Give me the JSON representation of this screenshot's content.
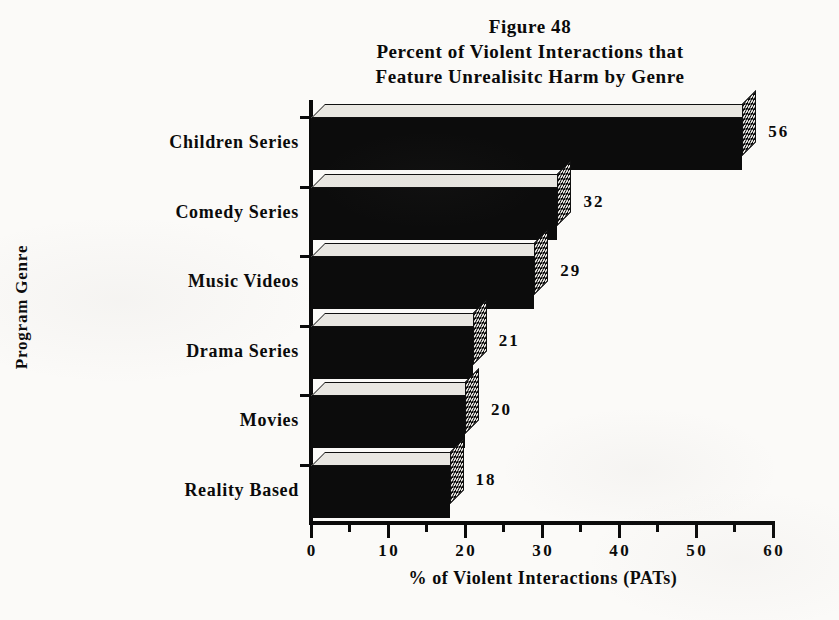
{
  "title": {
    "line1": "Figure 48",
    "line2": "Percent of Violent Interactions that",
    "line3": "Feature Unrealisitc Harm by Genre"
  },
  "axes": {
    "y_title": "Program Genre",
    "x_title": "% of Violent Interactions (PATs)"
  },
  "x_ticks": [
    "0",
    "10",
    "20",
    "30",
    "40",
    "50",
    "60"
  ],
  "chart_data": {
    "type": "bar",
    "orientation": "horizontal",
    "xlabel": "% of Violent Interactions (PATs)",
    "ylabel": "Program Genre",
    "categories": [
      "Children Series",
      "Comedy Series",
      "Music Videos",
      "Drama Series",
      "Movies",
      "Reality Based"
    ],
    "values": [
      56,
      32,
      29,
      21,
      20,
      18
    ],
    "value_labels": [
      "56",
      "32",
      "29",
      "21",
      "20",
      "18"
    ],
    "xlim": [
      0,
      60
    ],
    "xtick_major_step": 10,
    "xtick_minor_step": 5,
    "xticks": [
      0,
      10,
      20,
      30,
      40,
      50,
      60
    ],
    "grid": false,
    "legend": false,
    "style": "3d-block",
    "colors": {
      "bar_front": "#0c0c0c",
      "bar_top": "#e9e7e2",
      "bar_cap_pattern": "#f2f0ec",
      "axis": "#0a0a0a",
      "text": "#0a0a0a",
      "background": "#fbfaf8"
    }
  }
}
